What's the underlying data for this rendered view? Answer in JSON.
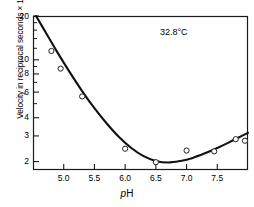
{
  "chart_data": {
    "type": "scatter",
    "title": "",
    "subtitle": "",
    "xlabel": "pH",
    "ylabel": "Velocity in reciprocal seconds × 1,000",
    "annotation": "32.8°C",
    "yscale": "log",
    "xscale": "linear",
    "xlim": [
      4.5,
      8.0
    ],
    "ylim": [
      1.75,
      20
    ],
    "grid": false,
    "legend": null,
    "xticks": [
      5.0,
      5.5,
      6.0,
      6.5,
      7.0,
      7.5
    ],
    "xtick_labels": [
      "5.0",
      "5.5",
      "6.0",
      "6.5",
      "7.0",
      "7.5"
    ],
    "yticks": [
      2,
      3,
      4,
      6,
      8,
      10,
      20
    ],
    "ytick_labels": [
      "2",
      "3",
      "4",
      "6",
      "8",
      "10",
      "20"
    ],
    "yticks_minor": [
      5,
      7,
      9,
      12,
      14,
      16,
      18
    ],
    "series": [
      {
        "name": "measured velocity",
        "marker": "open-circle",
        "x": [
          4.8,
          4.95,
          5.3,
          6.0,
          6.5,
          7.0,
          7.45,
          7.8,
          7.95
        ],
        "y": [
          11.5,
          8.7,
          5.6,
          2.45,
          1.98,
          2.38,
          2.35,
          2.85,
          2.78
        ]
      },
      {
        "name": "fitted curve",
        "marker": "none",
        "x": [
          4.55,
          4.7,
          4.9,
          5.1,
          5.3,
          5.5,
          5.7,
          5.9,
          6.1,
          6.3,
          6.5,
          6.7,
          6.9,
          7.1,
          7.3,
          7.5,
          7.7,
          7.9,
          8.0
        ],
        "y": [
          20.0,
          15.6,
          11.2,
          8.2,
          6.1,
          4.65,
          3.65,
          2.95,
          2.48,
          2.18,
          2.02,
          1.97,
          2.02,
          2.12,
          2.28,
          2.48,
          2.72,
          3.0,
          3.15
        ]
      }
    ]
  },
  "axes": {
    "annotation_label": "32.8°C",
    "x_axis_title": "pH",
    "x_axis_title_italic_prefix": "p",
    "x_axis_title_rest": "H",
    "y_axis_title": "Velocity in reciprocal seconds × 1,000"
  }
}
